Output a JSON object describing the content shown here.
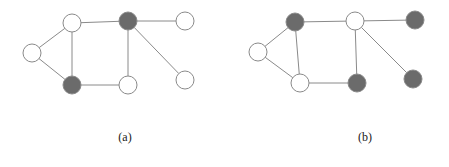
{
  "figure": {
    "background_color": "#ffffff",
    "edge_color": "#8a8a8a",
    "edge_width": 1,
    "node_radius": 9,
    "node_fill_white": "#ffffff",
    "node_fill_dark": "#6b6b6b",
    "node_stroke": "#8a8a8a",
    "node_stroke_width": 1,
    "panels": [
      {
        "id": "panel-a",
        "caption": "(a)",
        "caption_position": {
          "x": 125,
          "y": 138
        },
        "nodes": [
          {
            "id": "a-left",
            "label": "left",
            "x": 32,
            "y": 53,
            "fill": "white"
          },
          {
            "id": "a-top-left",
            "label": "top-left",
            "x": 72,
            "y": 23,
            "fill": "white"
          },
          {
            "id": "a-top-mid",
            "label": "top-middle",
            "x": 128,
            "y": 21,
            "fill": "dark"
          },
          {
            "id": "a-top-right",
            "label": "top-right",
            "x": 185,
            "y": 21,
            "fill": "white"
          },
          {
            "id": "a-bot-left",
            "label": "bottom-left",
            "x": 72,
            "y": 85,
            "fill": "dark"
          },
          {
            "id": "a-bot-mid",
            "label": "bottom-middle",
            "x": 128,
            "y": 85,
            "fill": "white"
          },
          {
            "id": "a-bot-right",
            "label": "bottom-right",
            "x": 185,
            "y": 80,
            "fill": "white"
          }
        ],
        "edges": [
          {
            "from": "a-left",
            "to": "a-top-left"
          },
          {
            "from": "a-left",
            "to": "a-bot-left"
          },
          {
            "from": "a-top-left",
            "to": "a-top-mid"
          },
          {
            "from": "a-top-left",
            "to": "a-bot-left"
          },
          {
            "from": "a-top-mid",
            "to": "a-top-right"
          },
          {
            "from": "a-top-mid",
            "to": "a-bot-mid"
          },
          {
            "from": "a-top-mid",
            "to": "a-bot-right"
          },
          {
            "from": "a-bot-left",
            "to": "a-bot-mid"
          }
        ]
      },
      {
        "id": "panel-b",
        "caption": "(b)",
        "caption_position": {
          "x": 365,
          "y": 138
        },
        "nodes": [
          {
            "id": "b-left",
            "label": "left",
            "x": 258,
            "y": 52,
            "fill": "white"
          },
          {
            "id": "b-top-left",
            "label": "top-left",
            "x": 295,
            "y": 22,
            "fill": "dark"
          },
          {
            "id": "b-top-mid",
            "label": "top-middle",
            "x": 355,
            "y": 21,
            "fill": "white"
          },
          {
            "id": "b-top-right",
            "label": "top-right",
            "x": 415,
            "y": 20,
            "fill": "dark"
          },
          {
            "id": "b-bot-left",
            "label": "bottom-left",
            "x": 300,
            "y": 83,
            "fill": "white"
          },
          {
            "id": "b-bot-mid",
            "label": "bottom-middle",
            "x": 357,
            "y": 83,
            "fill": "dark"
          },
          {
            "id": "b-bot-right",
            "label": "bottom-right",
            "x": 413,
            "y": 79,
            "fill": "dark"
          }
        ],
        "edges": [
          {
            "from": "b-left",
            "to": "b-top-left"
          },
          {
            "from": "b-left",
            "to": "b-bot-left"
          },
          {
            "from": "b-top-left",
            "to": "b-top-mid"
          },
          {
            "from": "b-top-left",
            "to": "b-bot-left"
          },
          {
            "from": "b-top-mid",
            "to": "b-top-right"
          },
          {
            "from": "b-top-mid",
            "to": "b-bot-mid"
          },
          {
            "from": "b-top-mid",
            "to": "b-bot-right"
          },
          {
            "from": "b-bot-left",
            "to": "b-bot-mid"
          }
        ]
      }
    ]
  }
}
